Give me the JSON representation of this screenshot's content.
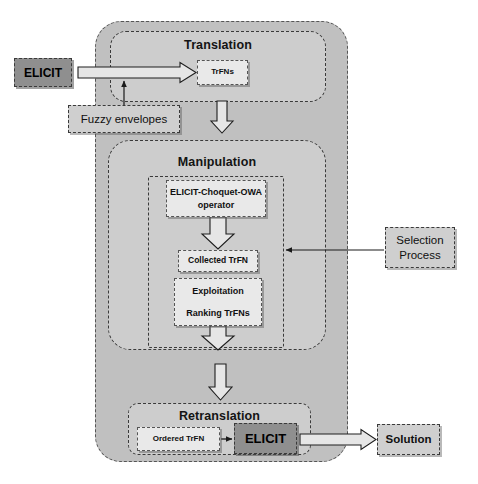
{
  "diagram": {
    "colors": {
      "outer_container_fill": "#c0c0c0",
      "phase_fill": "#cdcdcd",
      "node_fill": "#e9e9e9",
      "elicit_fill": "#8f8f8f",
      "label_fill": "#cfcfcf",
      "stroke": "#3a3a3a",
      "background": "#ffffff"
    },
    "phases": [
      {
        "id": "translation",
        "label": "Translation"
      },
      {
        "id": "manipulation",
        "label": "Manipulation"
      },
      {
        "id": "retranslation",
        "label": "Retranslation"
      }
    ],
    "nodes": {
      "elicit_input": "ELICIT",
      "trfns": "TrFNs",
      "owa_operator_line1": "ELICIT-Choquet-OWA",
      "owa_operator_line2": "operator",
      "collected_trfn": "Collected TrFN",
      "exploitation": "Exploitation",
      "ranking_trfns": "Ranking TrFNs",
      "ordered_trfn": "Ordered TrFN",
      "elicit_output": "ELICIT"
    },
    "side_labels": {
      "fuzzy_envelopes": "Fuzzy envelopes",
      "selection_process_line1": "Selection",
      "selection_process_line2": "Process",
      "solution": "Solution"
    },
    "arrows": [
      {
        "id": "elicit-to-trfns",
        "style": "block",
        "direction": "right"
      },
      {
        "id": "fuzzy-envelopes-to-flow",
        "style": "line",
        "direction": "up"
      },
      {
        "id": "translation-to-manipulation",
        "style": "block",
        "direction": "down"
      },
      {
        "id": "owa-to-collected",
        "style": "block",
        "direction": "down"
      },
      {
        "id": "exploitation-to-out",
        "style": "block",
        "direction": "down"
      },
      {
        "id": "manipulation-to-retranslation",
        "style": "block",
        "direction": "down"
      },
      {
        "id": "selection-process-to-manipulation",
        "style": "line",
        "direction": "left"
      },
      {
        "id": "ordered-trfn-to-elicit",
        "style": "line",
        "direction": "right"
      },
      {
        "id": "elicit-to-solution",
        "style": "block",
        "direction": "right"
      }
    ]
  }
}
